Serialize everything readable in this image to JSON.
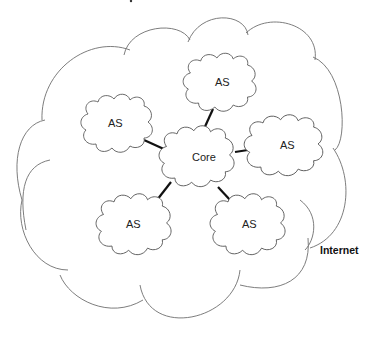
{
  "diagram": {
    "type": "network-topology",
    "outer_cloud": {
      "label": "Internet"
    },
    "core": {
      "label": "Core"
    },
    "autonomous_systems": [
      {
        "id": "as-top",
        "label": "AS"
      },
      {
        "id": "as-left",
        "label": "AS"
      },
      {
        "id": "as-right",
        "label": "AS"
      },
      {
        "id": "as-bottom-left",
        "label": "AS"
      },
      {
        "id": "as-bottom-right",
        "label": "AS"
      }
    ],
    "links": [
      {
        "from": "Core",
        "to": "as-top"
      },
      {
        "from": "Core",
        "to": "as-left"
      },
      {
        "from": "Core",
        "to": "as-right"
      },
      {
        "from": "Core",
        "to": "as-bottom-left"
      },
      {
        "from": "Core",
        "to": "as-bottom-right"
      }
    ],
    "colors": {
      "outline": "#6e6e6e",
      "link": "#111111",
      "text": "#222222",
      "background": "#ffffff"
    }
  }
}
